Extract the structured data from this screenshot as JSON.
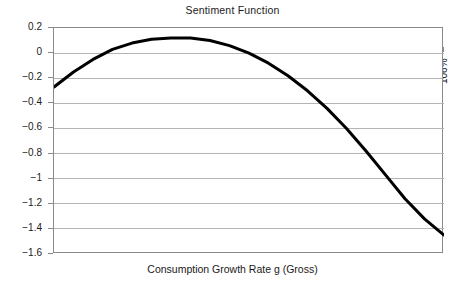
{
  "chart_data": {
    "type": "line",
    "title": "Sentiment Function",
    "xlabel": "Consumption Growth Rate g (Gross)",
    "ylabel": "",
    "xlim": [
      96,
      106
    ],
    "ylim": [
      -1.6,
      0.2
    ],
    "grid": "horizontal",
    "legend": "none",
    "series": [
      {
        "name": "Sentiment Function",
        "color": "#000000",
        "x": [
          96.0,
          96.5,
          97.0,
          97.5,
          98.0,
          98.5,
          99.0,
          99.5,
          100.0,
          100.5,
          101.0,
          101.5,
          102.0,
          102.5,
          103.0,
          103.5,
          104.0,
          104.5,
          105.0,
          105.5,
          106.0
        ],
        "y": [
          -0.27,
          -0.15,
          -0.05,
          0.03,
          0.08,
          0.11,
          0.12,
          0.12,
          0.1,
          0.06,
          0.0,
          -0.08,
          -0.18,
          -0.3,
          -0.44,
          -0.6,
          -0.78,
          -0.97,
          -1.16,
          -1.32,
          -1.45
        ]
      }
    ],
    "x_ticks": [
      {
        "value": 96,
        "label": "96%"
      },
      {
        "value": 97,
        "label": "97%"
      },
      {
        "value": 99,
        "label": "99%"
      },
      {
        "value": 101,
        "label": "101%"
      },
      {
        "value": 103,
        "label": "103%"
      },
      {
        "value": 104,
        "label": "104%"
      },
      {
        "value": 106,
        "label": "106%"
      }
    ],
    "y_ticks": [
      {
        "value": 0.2,
        "label": "0.2"
      },
      {
        "value": 0.0,
        "label": "0"
      },
      {
        "value": -0.2,
        "label": "−0.2"
      },
      {
        "value": -0.4,
        "label": "−0.4"
      },
      {
        "value": -0.6,
        "label": "−0.6"
      },
      {
        "value": -0.8,
        "label": "−0.8"
      },
      {
        "value": -1.0,
        "label": "−1"
      },
      {
        "value": -1.2,
        "label": "−1.2"
      },
      {
        "value": -1.4,
        "label": "−1.4"
      },
      {
        "value": -1.6,
        "label": "−1.6"
      }
    ],
    "colors": {
      "curve": "#000000",
      "gridline": "#b4b4b4",
      "axis": "#8a8a8a",
      "background": "#ffffff",
      "text": "#1a1a1a"
    }
  }
}
